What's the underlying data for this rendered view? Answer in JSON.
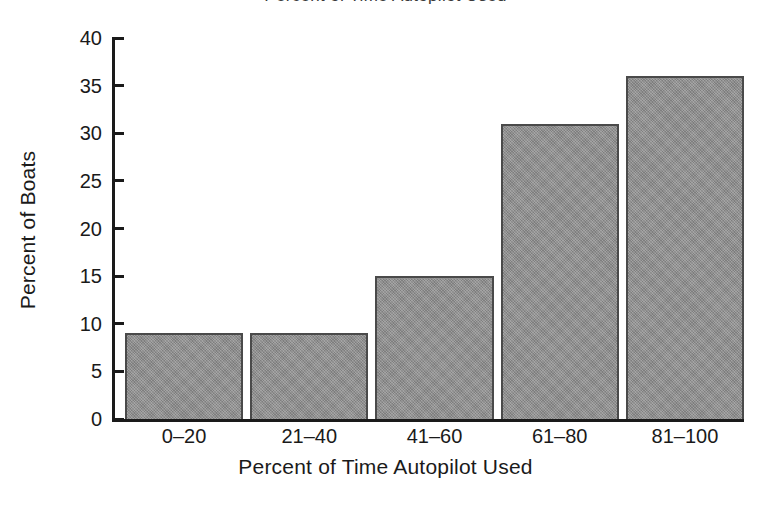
{
  "figure": {
    "title_remnant": "Percent of Time Autopilot Used",
    "background_color": "#ffffff",
    "axis_color": "#1a1a1a",
    "bar_fill_color": "#8a8a8a",
    "bar_edge_color": "#4a4a4a"
  },
  "chart_data": {
    "type": "bar",
    "title": "",
    "xlabel": "Percent of Time Autopilot Used",
    "ylabel": "Percent of Boats",
    "categories": [
      "0–20",
      "21–40",
      "41–60",
      "61–80",
      "81–100"
    ],
    "values": [
      9,
      9,
      15,
      31,
      36
    ],
    "ylim": [
      0,
      40
    ],
    "yticks": [
      0,
      5,
      10,
      15,
      20,
      25,
      30,
      35,
      40
    ],
    "ytick_labels": [
      "0",
      "5",
      "10",
      "15",
      "20",
      "25",
      "30",
      "35",
      "40"
    ],
    "grid": false,
    "legend": false,
    "orientation": "vertical",
    "series": [
      {
        "name": "Percent of Boats",
        "values": [
          9,
          9,
          15,
          31,
          36
        ]
      }
    ]
  }
}
